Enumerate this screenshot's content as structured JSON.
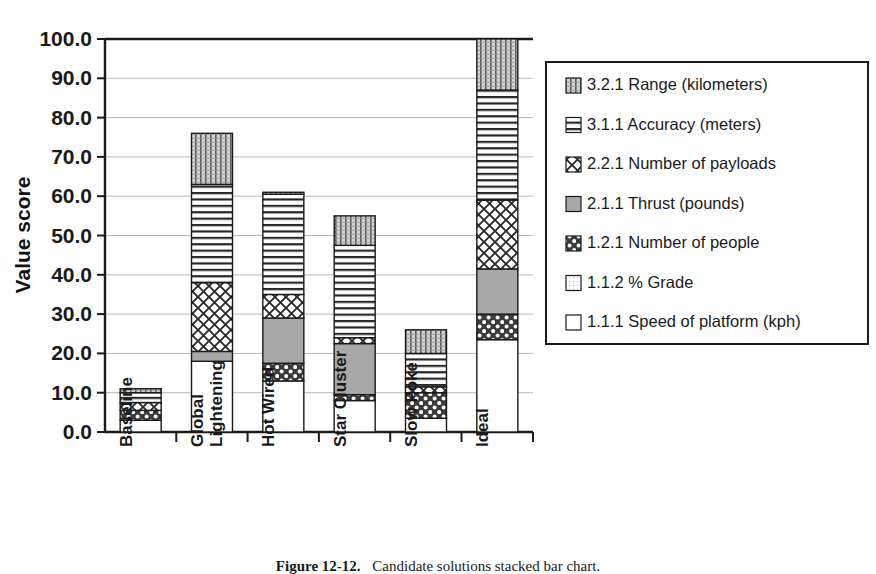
{
  "chart_data": {
    "type": "bar",
    "subtype": "stacked-bar",
    "title": "",
    "xlabel": "",
    "ylabel": "Value score",
    "ylim": [
      0,
      100
    ],
    "ytick_labels": [
      "0.0",
      "10.0",
      "20.0",
      "30.0",
      "40.0",
      "50.0",
      "60.0",
      "70.0",
      "80.0",
      "90.0",
      "100.0"
    ],
    "ytick_values": [
      0,
      10,
      20,
      30,
      40,
      50,
      60,
      70,
      80,
      90,
      100
    ],
    "grid": "horizontal",
    "legend_position": "right",
    "categories": [
      "Baseline",
      "Global Lightening",
      "Hot Wired",
      "Star Cluster",
      "Slow Poke",
      "Ideal"
    ],
    "series": [
      {
        "name": "1.1.1 Speed of platform (kph)",
        "key": "speed",
        "pattern": "solid-white",
        "values": [
          3.0,
          18.0,
          13.0,
          8.0,
          3.5,
          23.5
        ]
      },
      {
        "name": "1.1.2 % Grade",
        "key": "grade",
        "pattern": "fine-dots-light",
        "values": [
          0.0,
          0.0,
          0.0,
          0.0,
          0.0,
          0.0
        ]
      },
      {
        "name": "1.2.1 Number of people",
        "key": "people",
        "pattern": "dark-dots",
        "values": [
          2.5,
          0.0,
          4.5,
          1.5,
          6.5,
          6.5
        ]
      },
      {
        "name": "2.1.1 Thrust (pounds)",
        "key": "thrust",
        "pattern": "solid-gray",
        "values": [
          0.0,
          2.5,
          11.5,
          13.0,
          0.0,
          11.5
        ]
      },
      {
        "name": "2.2.1 Number of payloads",
        "key": "payloads",
        "pattern": "crosshatch",
        "values": [
          2.0,
          17.5,
          6.0,
          1.5,
          1.5,
          17.5
        ]
      },
      {
        "name": "3.1.1 Accuracy (meters)",
        "key": "accuracy",
        "pattern": "horizontal-lines",
        "values": [
          2.5,
          25.0,
          25.5,
          23.5,
          8.5,
          28.0
        ]
      },
      {
        "name": "3.2.1 Range (kilometers)",
        "key": "range",
        "pattern": "vertical-dotted",
        "values": [
          1.0,
          13.0,
          0.5,
          7.5,
          6.0,
          13.0
        ]
      }
    ],
    "totals": [
      11.0,
      76.0,
      61.0,
      55.0,
      26.0,
      100.0
    ]
  },
  "legend": {
    "items": [
      {
        "label": "3.2.1 Range (kilometers)",
        "pattern": "vertical-dotted"
      },
      {
        "label": "3.1.1 Accuracy (meters)",
        "pattern": "horizontal-lines"
      },
      {
        "label": "2.2.1 Number of payloads",
        "pattern": "crosshatch"
      },
      {
        "label": "2.1.1 Thrust (pounds)",
        "pattern": "solid-gray"
      },
      {
        "label": "1.2.1 Number of people",
        "pattern": "dark-dots"
      },
      {
        "label": "1.1.2 % Grade",
        "pattern": "fine-dots-light"
      },
      {
        "label": "1.1.1 Speed of platform (kph)",
        "pattern": "solid-white"
      }
    ]
  },
  "caption": {
    "figure_number": "Figure 12-12.",
    "text": "Candidate solutions stacked bar chart."
  },
  "colors": {
    "axis": "#1a1a1a",
    "gridline": "#b8b8b8",
    "gray_fill": "#a8a8a8",
    "bar_outline": "#1a1a1a",
    "background": "#ffffff"
  }
}
